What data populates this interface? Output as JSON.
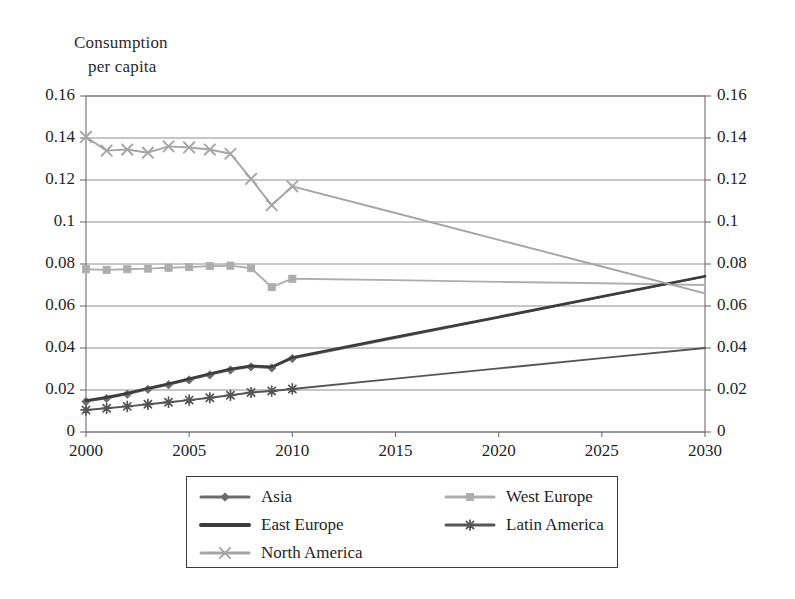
{
  "chart_data": {
    "type": "line",
    "title": "Consumption per capita",
    "title_lines": [
      "Consumption",
      "per capita"
    ],
    "xlabel": "",
    "ylabel": "Consumption per capita",
    "xlim": [
      2000,
      2030
    ],
    "ylim": [
      0,
      0.16
    ],
    "grid": true,
    "legend_position": "bottom",
    "x_ticks": [
      "2000",
      "2005",
      "2010",
      "2015",
      "2020",
      "2025",
      "2030"
    ],
    "x_tick_values": [
      2000,
      2005,
      2010,
      2015,
      2020,
      2025,
      2030
    ],
    "y_ticks": [
      "0",
      "0.02",
      "0.04",
      "0.06",
      "0.08",
      "0.1",
      "0.12",
      "0.14",
      "0.16"
    ],
    "y_tick_values": [
      0,
      0.02,
      0.04,
      0.06,
      0.08,
      0.1,
      0.12,
      0.14,
      0.16
    ],
    "y_axis_duplicated_right": true,
    "x": [
      2000,
      2001,
      2002,
      2003,
      2004,
      2005,
      2006,
      2007,
      2008,
      2009,
      2010,
      2015,
      2020,
      2025,
      2030
    ],
    "series": [
      {
        "name": "Asia",
        "marker": "diamond",
        "color": "#6b6b6b",
        "values": [
          0.0145,
          0.016,
          0.018,
          0.0203,
          0.0225,
          0.0248,
          0.0272,
          0.0295,
          0.031,
          0.0305,
          0.035,
          0.0447,
          0.0545,
          0.0643,
          0.074
        ]
      },
      {
        "name": "West Europe",
        "marker": "square",
        "color": "#adadad",
        "values": [
          0.0775,
          0.0772,
          0.0775,
          0.0778,
          0.0782,
          0.0785,
          0.079,
          0.0792,
          0.078,
          0.069,
          0.073,
          0.0723,
          0.0715,
          0.0708,
          0.07
        ]
      },
      {
        "name": "East Europe",
        "marker": "none",
        "color": "#3c3c3c",
        "values": [
          0.015,
          0.0165,
          0.0185,
          0.0208,
          0.023,
          0.0253,
          0.0277,
          0.03,
          0.0315,
          0.031,
          0.0355,
          0.0452,
          0.0548,
          0.0645,
          0.0742
        ]
      },
      {
        "name": "Latin America",
        "marker": "asterisk",
        "color": "#555555",
        "values": [
          0.0105,
          0.0113,
          0.0122,
          0.0132,
          0.0142,
          0.0152,
          0.0163,
          0.0175,
          0.0188,
          0.0195,
          0.0205,
          0.0254,
          0.0303,
          0.0352,
          0.04
        ]
      },
      {
        "name": "North America",
        "marker": "x",
        "color": "#a5a5a5",
        "values": [
          0.1405,
          0.134,
          0.1345,
          0.133,
          0.136,
          0.1355,
          0.1345,
          0.1325,
          0.1205,
          0.108,
          0.117,
          0.1043,
          0.0915,
          0.0788,
          0.066
        ]
      }
    ],
    "projection_note": "Historical markers 2000-2010; straight projection lines 2010-2030"
  },
  "legend": {
    "entries": [
      {
        "label": "Asia",
        "marker": "diamond-marker-icon"
      },
      {
        "label": "West Europe",
        "marker": "square-marker-icon"
      },
      {
        "label": "East Europe",
        "marker": "line-marker-icon"
      },
      {
        "label": "Latin America",
        "marker": "asterisk-marker-icon"
      },
      {
        "label": "North America",
        "marker": "x-marker-icon"
      }
    ]
  },
  "colors": {
    "asia": "#6b6b6b",
    "west_europe": "#adadad",
    "east_europe": "#3c3c3c",
    "latin_america": "#555555",
    "north_america": "#a5a5a5",
    "grid": "#8d8d8d",
    "frame": "#6f6f6f",
    "text": "#1f1f1f",
    "background": "#ffffff"
  }
}
